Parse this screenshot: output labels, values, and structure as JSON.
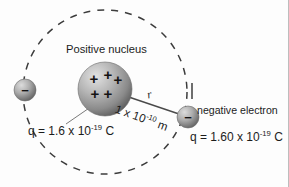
{
  "figure": {
    "background_color": "#fdfdfd",
    "border_color": "#bdbdbd"
  },
  "labels": {
    "nucleus": "Positive nucleus",
    "electron": "negative electron",
    "nucleus_charge": "q = 1.6 x 10",
    "nucleus_charge_exponent": "-19",
    "nucleus_charge_unit": " C",
    "electron_charge": "q = 1.60 x 10",
    "electron_charge_exponent": "-19",
    "electron_charge_unit": " C",
    "radius_symbol": "r",
    "distance": "1 x 10",
    "distance_exponent": "-10",
    "distance_unit": " m"
  },
  "objects": {
    "nucleus": {
      "name": "positive-nucleus",
      "cx": 105,
      "cy": 89,
      "r": 27,
      "charge_symbols": "+",
      "charge_count": 5,
      "fill_light": "#d8d8d8",
      "fill_dark": "#6f6f6f"
    },
    "electron_left": {
      "name": "electron-left",
      "cx": 25,
      "cy": 90,
      "r": 11,
      "charge_symbol": "-",
      "fill_light": "#cfcfcf",
      "fill_dark": "#6a6a6a"
    },
    "electron_right": {
      "name": "electron-right",
      "cx": 188,
      "cy": 117,
      "r": 11,
      "charge_symbol": "-",
      "fill_light": "#cfcfcf",
      "fill_dark": "#6a6a6a"
    },
    "orbit": {
      "name": "orbit-path",
      "cx": 105,
      "cy": 92,
      "r": 82,
      "style": "dashed",
      "color": "#3c3c3c"
    },
    "radius_line": {
      "name": "radius-line",
      "x1": 108,
      "y1": 90,
      "x2": 182,
      "y2": 115,
      "color": "#4a4a4a"
    },
    "leader_line": {
      "name": "nucleus-leader-line",
      "x1": 95,
      "y1": 103,
      "x2": 66,
      "y2": 124,
      "color": "#6a6a6a"
    },
    "tick_mark": {
      "name": "orbit-tick-mark",
      "x": 192,
      "y1": 83,
      "y2": 99,
      "color": "#4a4a4a"
    }
  },
  "colors": {
    "text": "#1c1c1c",
    "sphere_gray": "#9a9a9a",
    "dash_gray": "#3c3c3c"
  }
}
